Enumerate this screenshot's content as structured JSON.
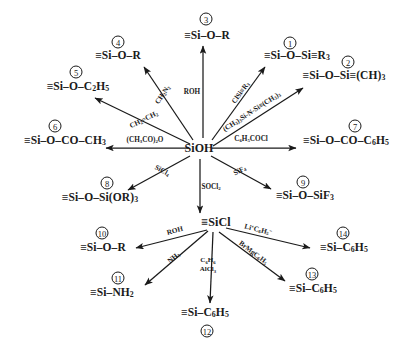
{
  "diagram": {
    "hubs": [
      {
        "id": "hub-sioh",
        "label": "SiOH",
        "x": 199,
        "y": 148
      },
      {
        "id": "hub-sicl",
        "label": "≡SiCl",
        "x": 216,
        "y": 222
      }
    ],
    "products": [
      {
        "num": "1",
        "name": "product-1",
        "label": "≡Si–O–Si≡R3",
        "x": 297,
        "y": 56,
        "badge_x": 290,
        "badge_y": 43
      },
      {
        "num": "2",
        "name": "product-2",
        "label": "≡Si–O–Si≡(CH)3",
        "x": 344,
        "y": 76,
        "badge_x": 348,
        "badge_y": 62
      },
      {
        "num": "3",
        "name": "product-3",
        "label": "≡Si–O–R",
        "x": 207,
        "y": 36,
        "badge_x": 206,
        "badge_y": 19
      },
      {
        "num": "4",
        "name": "product-4",
        "label": "≡Si–O–R",
        "x": 118,
        "y": 56,
        "badge_x": 118,
        "badge_y": 42
      },
      {
        "num": "5",
        "name": "product-5",
        "label": "≡Si–O–C2H5",
        "x": 78,
        "y": 87,
        "badge_x": 76,
        "badge_y": 72
      },
      {
        "num": "6",
        "name": "product-6",
        "label": "≡Si–O–CO–CH3",
        "x": 65,
        "y": 141,
        "badge_x": 55,
        "badge_y": 126
      },
      {
        "num": "7",
        "name": "product-7",
        "label": "≡Si–O–CO–C6H5",
        "x": 346,
        "y": 141,
        "badge_x": 355,
        "badge_y": 126
      },
      {
        "num": "8",
        "name": "product-8",
        "label": "≡Si–O–Si(OR)3",
        "x": 100,
        "y": 198,
        "badge_x": 107,
        "badge_y": 183
      },
      {
        "num": "9",
        "name": "product-9",
        "label": "≡Si–O–SiF3",
        "x": 305,
        "y": 196,
        "badge_x": 303,
        "badge_y": 182
      },
      {
        "num": "10",
        "name": "product-10",
        "label": "≡Si–O–R",
        "x": 103,
        "y": 248,
        "badge_x": 102,
        "badge_y": 233
      },
      {
        "num": "11",
        "name": "product-11",
        "label": "≡Si–NH2",
        "x": 112,
        "y": 293,
        "badge_x": 118,
        "badge_y": 278
      },
      {
        "num": "12",
        "name": "product-12",
        "label": "≡Si–C6H5",
        "x": 205,
        "y": 313,
        "badge_x": 207,
        "badge_y": 331
      },
      {
        "num": "13",
        "name": "product-13",
        "label": "≡Si–C6H5",
        "x": 313,
        "y": 289,
        "badge_x": 312,
        "badge_y": 274
      },
      {
        "num": "14",
        "name": "product-14",
        "label": "≡Si–C6H5",
        "x": 344,
        "y": 248,
        "badge_x": 343,
        "badge_y": 233
      }
    ],
    "arrows": [
      {
        "name": "arrow-to-1",
        "x1": 212,
        "y1": 140,
        "x2": 265,
        "y2": 67
      },
      {
        "name": "arrow-to-2",
        "x1": 213,
        "y1": 146,
        "x2": 303,
        "y2": 88
      },
      {
        "name": "arrow-to-3",
        "x1": 203,
        "y1": 138,
        "x2": 203,
        "y2": 46
      },
      {
        "name": "arrow-to-4",
        "x1": 193,
        "y1": 140,
        "x2": 144,
        "y2": 67
      },
      {
        "name": "arrow-to-5",
        "x1": 190,
        "y1": 144,
        "x2": 95,
        "y2": 98
      },
      {
        "name": "arrow-to-6",
        "x1": 188,
        "y1": 148,
        "x2": 106,
        "y2": 148
      },
      {
        "name": "arrow-to-7",
        "x1": 212,
        "y1": 148,
        "x2": 296,
        "y2": 148
      },
      {
        "name": "arrow-to-8",
        "x1": 190,
        "y1": 156,
        "x2": 128,
        "y2": 190
      },
      {
        "name": "arrow-to-9",
        "x1": 211,
        "y1": 156,
        "x2": 271,
        "y2": 189
      },
      {
        "name": "arrow-to-sicl",
        "x1": 200,
        "y1": 159,
        "x2": 200,
        "y2": 213
      },
      {
        "name": "arrow-to-10",
        "x1": 207,
        "y1": 230,
        "x2": 136,
        "y2": 248
      },
      {
        "name": "arrow-to-11",
        "x1": 208,
        "y1": 231,
        "x2": 145,
        "y2": 285
      },
      {
        "name": "arrow-to-12",
        "x1": 213,
        "y1": 232,
        "x2": 210,
        "y2": 303
      },
      {
        "name": "arrow-to-13",
        "x1": 219,
        "y1": 232,
        "x2": 285,
        "y2": 281
      },
      {
        "name": "arrow-to-14",
        "x1": 226,
        "y1": 228,
        "x2": 310,
        "y2": 248
      }
    ],
    "reagents": [
      {
        "name": "reagent-ch2n2",
        "label": "CH2N2",
        "x": 163,
        "y": 95,
        "rot": -56
      },
      {
        "name": "reagent-ethylene",
        "label": "CH2=CH2",
        "x": 144,
        "y": 120,
        "rot": -26
      },
      {
        "name": "reagent-acetic-anh",
        "label": "(CH3CO)2O",
        "x": 145,
        "y": 140,
        "rot": 0
      },
      {
        "name": "reagent-roh-top",
        "label": "ROH",
        "x": 192,
        "y": 92,
        "rot": 0
      },
      {
        "name": "reagent-clsir3",
        "label": "ClSi≡R3",
        "x": 241,
        "y": 93,
        "rot": -54
      },
      {
        "name": "reagent-hmds",
        "label": "(CH3)3Si-N-Si≡(CH3)3",
        "x": 252,
        "y": 112,
        "rot": -33
      },
      {
        "name": "reagent-benzoyl-cl",
        "label": "C6H5COCl",
        "x": 251,
        "y": 139,
        "rot": 0
      },
      {
        "name": "reagent-sicl4",
        "label": "SiCl4",
        "x": 162,
        "y": 171,
        "rot": 29
      },
      {
        "name": "reagent-socl2",
        "label": "SOCl2",
        "x": 211,
        "y": 187,
        "rot": 0
      },
      {
        "name": "reagent-sif4",
        "label": "SiF4",
        "x": 240,
        "y": 171,
        "rot": -28
      },
      {
        "name": "reagent-roh-bottom",
        "label": "ROH",
        "x": 175,
        "y": 231,
        "rot": -15
      },
      {
        "name": "reagent-nh3",
        "label": "NH3",
        "x": 174,
        "y": 258,
        "rot": -40
      },
      {
        "name": "reagent-benzene-alcl3",
        "label": "C6H6 / AlCl3",
        "x": 208,
        "y": 265,
        "rot": 0
      },
      {
        "name": "reagent-phli",
        "label": "Li⁺C6H5⁻",
        "x": 258,
        "y": 230,
        "rot": 14
      },
      {
        "name": "reagent-grignard",
        "label": "BrMgC6H5",
        "x": 253,
        "y": 253,
        "rot": 37
      }
    ]
  }
}
